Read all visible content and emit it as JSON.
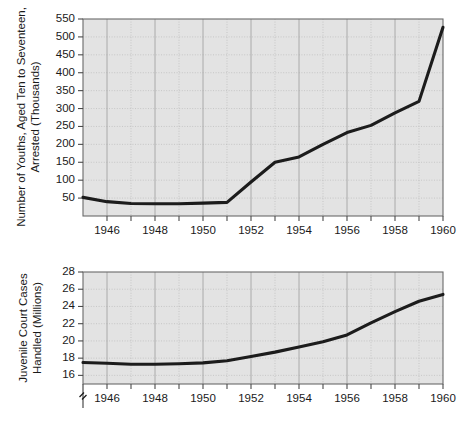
{
  "chart_data": [
    {
      "id": "youth-arrests",
      "type": "line",
      "title": "",
      "xlabel": "",
      "ylabel": "Number of Youths, Aged Ten to Seventeen, Arrested (Thousands)",
      "ylabel_lines": [
        "Number of Youths, Aged Ten to Seventeen,",
        "Arrested (Thousands)"
      ],
      "xlim": [
        1945,
        1960
      ],
      "ylim": [
        0,
        550
      ],
      "yticks": [
        50,
        100,
        150,
        200,
        250,
        300,
        350,
        400,
        450,
        500,
        550
      ],
      "ytick_labels": [
        "50",
        "100",
        "150",
        "200",
        "250",
        "300",
        "350",
        "400",
        "450",
        "500",
        "550"
      ],
      "xticks": [
        1946,
        1947,
        1948,
        1949,
        1950,
        1951,
        1952,
        1953,
        1954,
        1955,
        1956,
        1957,
        1958,
        1959,
        1960
      ],
      "xtick_labels_shown": [
        "1946",
        "1948",
        "1950",
        "1952",
        "1954",
        "1956",
        "1958",
        "1960"
      ],
      "xtick_labeled_years": [
        1946,
        1948,
        1950,
        1952,
        1954,
        1956,
        1958,
        1960
      ],
      "grid": true,
      "legend": false,
      "series": [
        {
          "name": "Youths aged 10 to 17 arrested (thousands)",
          "x": [
            1945,
            1946,
            1947,
            1948,
            1949,
            1950,
            1951,
            1952,
            1953,
            1954,
            1955,
            1956,
            1957,
            1958,
            1959,
            1960
          ],
          "values": [
            52,
            40,
            35,
            34,
            34,
            36,
            38,
            95,
            150,
            165,
            200,
            233,
            253,
            288,
            320,
            527
          ]
        }
      ]
    },
    {
      "id": "juvenile-court-cases",
      "type": "line",
      "title": "",
      "xlabel": "",
      "ylabel": "Juvenile Court Cases Handled (Millions)",
      "ylabel_lines": [
        "Juvenile Court Cases",
        "Handled (Millions)"
      ],
      "xlim": [
        1945,
        1960
      ],
      "ylim": [
        15,
        28
      ],
      "y_axis_break": true,
      "yticks": [
        16,
        18,
        20,
        22,
        24,
        26,
        28
      ],
      "ytick_labels": [
        "16",
        "18",
        "20",
        "22",
        "24",
        "26",
        "28"
      ],
      "xticks": [
        1946,
        1947,
        1948,
        1949,
        1950,
        1951,
        1952,
        1953,
        1954,
        1955,
        1956,
        1957,
        1958,
        1959,
        1960
      ],
      "xtick_labels_shown": [
        "1946",
        "1948",
        "1950",
        "1952",
        "1954",
        "1956",
        "1958",
        "1960"
      ],
      "xtick_labeled_years": [
        1946,
        1948,
        1950,
        1952,
        1954,
        1956,
        1958,
        1960
      ],
      "grid": true,
      "legend": false,
      "series": [
        {
          "name": "Juvenile court cases handled (millions)",
          "x": [
            1945,
            1946,
            1947,
            1948,
            1949,
            1950,
            1951,
            1952,
            1953,
            1954,
            1955,
            1956,
            1957,
            1958,
            1959,
            1960
          ],
          "values": [
            17.5,
            17.4,
            17.3,
            17.3,
            17.35,
            17.45,
            17.7,
            18.2,
            18.7,
            19.3,
            19.9,
            20.7,
            22.1,
            23.4,
            24.6,
            25.4
          ]
        }
      ]
    }
  ],
  "colors": {
    "plot_background": "#e3e3e3",
    "data_line": "#1c1c1c",
    "grid_major": "#9d9d9d",
    "grid_minor": "#b4b4b4",
    "axis": "#4a4a4a",
    "text": "#1a1a1a",
    "page_background": "#ffffff"
  }
}
